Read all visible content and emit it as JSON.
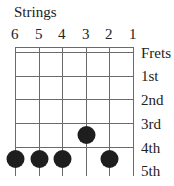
{
  "diagram": {
    "title": "Strings",
    "string_numbers": [
      "6",
      "5",
      "4",
      "3",
      "2",
      "1"
    ],
    "frets_label": "Frets",
    "fret_labels": [
      "1st",
      "2nd",
      "3rd",
      "4th",
      "5th"
    ],
    "dots": [
      {
        "string": 3,
        "fret": 4
      },
      {
        "string": 6,
        "fret": 5
      },
      {
        "string": 5,
        "fret": 5
      },
      {
        "string": 4,
        "fret": 5
      },
      {
        "string": 2,
        "fret": 5
      }
    ],
    "colors": {
      "line": "#666666",
      "dot": "#1e1e1e"
    }
  }
}
